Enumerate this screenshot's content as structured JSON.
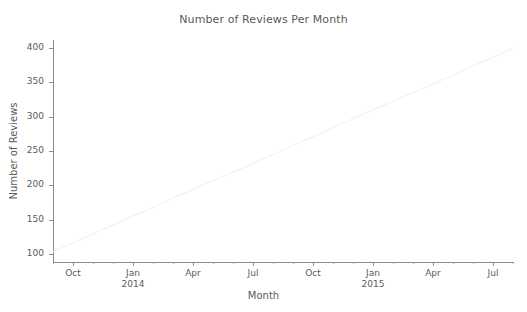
{
  "figure": {
    "background_color": "#ffffff",
    "spine_color": "#8b8b8b",
    "text_color": "#5a5a5a"
  },
  "chart_data": {
    "type": "line",
    "title": "Number of Reviews Per Month",
    "xlabel": "Month",
    "ylabel": "Number of Reviews",
    "grid": false,
    "legend": null,
    "line_color": "#f2f2f2",
    "ylim": [
      88,
      412
    ],
    "yticks": [
      100,
      150,
      200,
      250,
      300,
      350,
      400
    ],
    "ytick_labels": [
      "100",
      "150",
      "200",
      "250",
      "300",
      "350",
      "400"
    ],
    "xtick_labels": [
      {
        "label": "Oct",
        "sub": ""
      },
      {
        "label": "Jan",
        "sub": "2014"
      },
      {
        "label": "Apr",
        "sub": ""
      },
      {
        "label": "Jul",
        "sub": ""
      },
      {
        "label": "Oct",
        "sub": ""
      },
      {
        "label": "Jan",
        "sub": "2015"
      },
      {
        "label": "Apr",
        "sub": ""
      },
      {
        "label": "Jul",
        "sub": ""
      }
    ],
    "x": [
      "2013-09",
      "2013-10",
      "2013-11",
      "2013-12",
      "2014-01",
      "2014-02",
      "2014-03",
      "2014-04",
      "2014-05",
      "2014-06",
      "2014-07",
      "2014-08",
      "2014-09",
      "2014-10",
      "2014-11",
      "2014-12",
      "2015-01",
      "2015-02",
      "2015-03",
      "2015-04",
      "2015-05",
      "2015-06",
      "2015-07",
      "2015-08"
    ],
    "values": [
      103,
      116,
      129,
      142,
      155,
      168,
      181,
      194,
      207,
      219,
      232,
      245,
      258,
      271,
      284,
      297,
      310,
      323,
      335,
      348,
      361,
      374,
      387,
      400
    ],
    "series": [
      {
        "name": "Number of Reviews",
        "values": [
          103,
          116,
          129,
          142,
          155,
          168,
          181,
          194,
          207,
          219,
          232,
          245,
          258,
          271,
          284,
          297,
          310,
          323,
          335,
          348,
          361,
          374,
          387,
          400
        ]
      }
    ]
  }
}
